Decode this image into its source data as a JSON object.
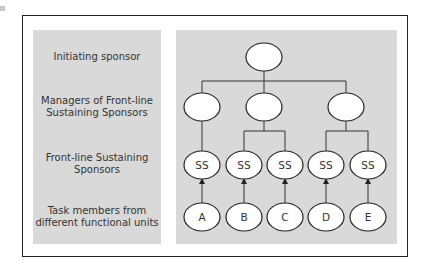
{
  "rows": [
    {
      "label": "Initiating sponsor"
    },
    {
      "label": "Managers of Front-line Sustaining Sponsors"
    },
    {
      "label": "Front-line Sustaining Sponsors"
    },
    {
      "label": "Task members from different functional units"
    }
  ],
  "labels": {
    "row0": "Initiating sponsor",
    "row1_line1": "Managers of Front-line",
    "row1_line2": "Sustaining Sponsors",
    "row2_line1": "Front-line Sustaining",
    "row2_line2": "Sponsors",
    "row3_line1": "Task members from",
    "row3_line2": "different functional units"
  },
  "nodes": {
    "initiating": "",
    "managers": [
      "",
      "",
      ""
    ],
    "sustaining": [
      "SS",
      "SS",
      "SS",
      "SS",
      "SS"
    ],
    "task_members": [
      "A",
      "B",
      "C",
      "D",
      "E"
    ]
  },
  "colors": {
    "panel": "#d9d9d9",
    "border": "#222222",
    "node_fill": "#ffffff",
    "line": "#333333"
  }
}
